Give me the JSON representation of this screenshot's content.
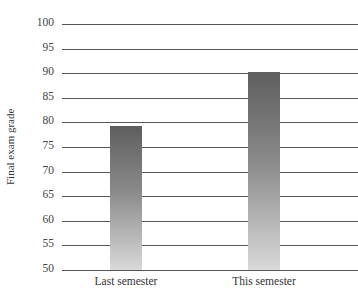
{
  "chart_data": {
    "type": "bar",
    "title": "",
    "xlabel": "",
    "ylabel": "Final exam grade",
    "categories": [
      "Last semester",
      "This semester"
    ],
    "values": [
      79.3,
      90.2
    ],
    "ylim": [
      50,
      100
    ],
    "yticks": [
      50,
      55,
      60,
      65,
      70,
      75,
      80,
      85,
      90,
      95,
      100
    ],
    "grid": true,
    "legend": null,
    "bar_fill": "vertical gradient dark gray (#5e5e5e) to light gray (#d9d9d9)"
  }
}
